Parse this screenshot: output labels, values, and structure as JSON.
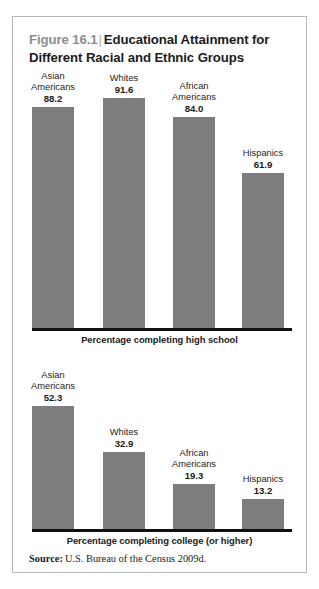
{
  "figure": {
    "number": "Figure 16.1",
    "divider": "|",
    "title": "Educational Attainment for Different Racial and Ethnic Groups",
    "source_label": "Source:",
    "source_text": "U.S. Bureau of the Census 2009d.",
    "bar_color": "#7d7d7d",
    "number_color": "#8d8d8d",
    "border_color": "#b9b9b9"
  },
  "chart_data": [
    {
      "type": "bar",
      "title": "Percentage completing high school",
      "xlabel": "Percentage completing high school",
      "ylabel": "",
      "ylim": [
        0,
        100
      ],
      "grid": false,
      "legend": "none",
      "categories": [
        "Asian Americans",
        "Whites",
        "African Americans",
        "Hispanics"
      ],
      "category_lines": [
        [
          "Asian",
          "Americans"
        ],
        [
          "Whites"
        ],
        [
          "African",
          "Americans"
        ],
        [
          "Hispanics"
        ]
      ],
      "values": [
        88.2,
        91.6,
        84.0,
        61.9
      ],
      "value_labels": [
        "88.2",
        "91.6",
        "84.0",
        "61.9"
      ]
    },
    {
      "type": "bar",
      "title": "Percentage completing college (or higher)",
      "xlabel": "Percentage completing college (or higher)",
      "ylabel": "",
      "ylim": [
        0,
        100
      ],
      "grid": false,
      "legend": "none",
      "categories": [
        "Asian Americans",
        "Whites",
        "African Americans",
        "Hispanics"
      ],
      "category_lines": [
        [
          "Asian",
          "Americans"
        ],
        [
          "Whites"
        ],
        [
          "African",
          "Americans"
        ],
        [
          "Hispanics"
        ]
      ],
      "values": [
        52.3,
        32.9,
        19.3,
        13.2
      ],
      "value_labels": [
        "52.3",
        "32.9",
        "19.3",
        "13.2"
      ]
    }
  ]
}
